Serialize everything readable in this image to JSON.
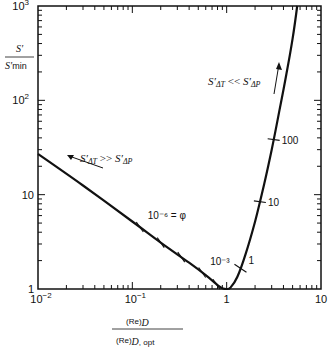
{
  "chart_data": {
    "type": "line",
    "title": "",
    "xscale": "log",
    "yscale": "log",
    "xlim": [
      0.01,
      10
    ],
    "ylim": [
      1,
      1000
    ],
    "grid": false,
    "xlabel": {
      "numerator": "(Re)D",
      "denominator": "(Re)D, opt"
    },
    "ylabel": {
      "numerator": "S'",
      "denominator": "S'min"
    },
    "x_ticks": [
      {
        "value": 0.01,
        "label_base": "10",
        "label_exp": "−2"
      },
      {
        "value": 0.1,
        "label_base": "10",
        "label_exp": "−1"
      },
      {
        "value": 1,
        "label_base": "1",
        "label_exp": ""
      },
      {
        "value": 10,
        "label_base": "10",
        "label_exp": ""
      }
    ],
    "y_ticks": [
      {
        "value": 1,
        "label_base": "1",
        "label_exp": ""
      },
      {
        "value": 10,
        "label_base": "10",
        "label_exp": ""
      },
      {
        "value": 100,
        "label_base": "10",
        "label_exp": "2"
      },
      {
        "value": 1000,
        "label_base": "10",
        "label_exp": "3"
      }
    ],
    "series": [
      {
        "name": "S'/S'min vs (Re)D/(Re)D,opt",
        "x": [
          0.01,
          0.03,
          0.1,
          0.2,
          0.4,
          0.6,
          0.8,
          0.9,
          1.0,
          1.1,
          1.3,
          1.6,
          2.0,
          2.5,
          3.0,
          3.6,
          4.3,
          5.0,
          5.6
        ],
        "y": [
          27,
          12.5,
          5.2,
          3.1,
          1.9,
          1.4,
          1.1,
          1.02,
          1.0,
          1.04,
          1.35,
          2.4,
          5.2,
          13,
          30,
          75,
          190,
          450,
          1000
        ]
      }
    ],
    "phi_markers": [
      {
        "x": 0.12,
        "label": "10⁻⁶ = φ",
        "show_label": true
      },
      {
        "x": 0.2,
        "label": "",
        "show_label": false
      },
      {
        "x": 0.33,
        "label": "",
        "show_label": false
      },
      {
        "x": 0.55,
        "label": "10⁻³",
        "show_label": true
      },
      {
        "x": 0.78,
        "label": "",
        "show_label": false
      },
      {
        "x": 1.4,
        "label": "1",
        "show_label": true
      },
      {
        "x": 2.25,
        "label": "10",
        "show_label": true
      },
      {
        "x": 3.15,
        "label": "100",
        "show_label": true
      }
    ],
    "annotations": [
      {
        "text_main": "S'",
        "text_sub": "ΔT",
        "relation": ">>",
        "text_main2": "S'",
        "text_sub2": "ΔP",
        "arrow": "up-left",
        "region": "left branch"
      },
      {
        "text_main": "S'",
        "text_sub": "ΔT",
        "relation": "<<",
        "text_main2": "S'",
        "text_sub2": "ΔP",
        "arrow": "up",
        "region": "right branch"
      }
    ]
  }
}
